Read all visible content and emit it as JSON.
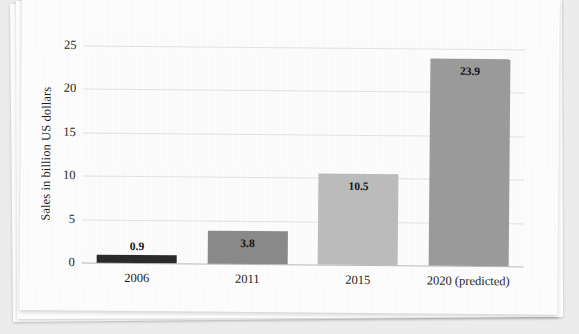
{
  "chart_data": {
    "type": "bar",
    "title": "",
    "xlabel": "",
    "ylabel": "Sales in billion US dollars",
    "categories": [
      "2006",
      "2011",
      "2015",
      "2020 (predicted)"
    ],
    "values": [
      0.9,
      3.8,
      10.5,
      23.9
    ],
    "value_labels": [
      "0.9",
      "3.8",
      "10.5",
      "23.9"
    ],
    "bar_colors": [
      "#2b2b2b",
      "#8a8a8a",
      "#bcbcbc",
      "#9b9b9b"
    ],
    "label_placement": [
      "above",
      "inside",
      "inside",
      "inside"
    ],
    "ylim": [
      0,
      26.5
    ],
    "yticks": [
      0,
      5,
      10,
      15,
      20,
      25
    ],
    "ytick_labels": [
      "0",
      "5",
      "10",
      "15",
      "20",
      "25"
    ],
    "grid": true,
    "legend": "none"
  },
  "page": {
    "background_color": "#ececed",
    "card_color": "#fdfdfd"
  }
}
